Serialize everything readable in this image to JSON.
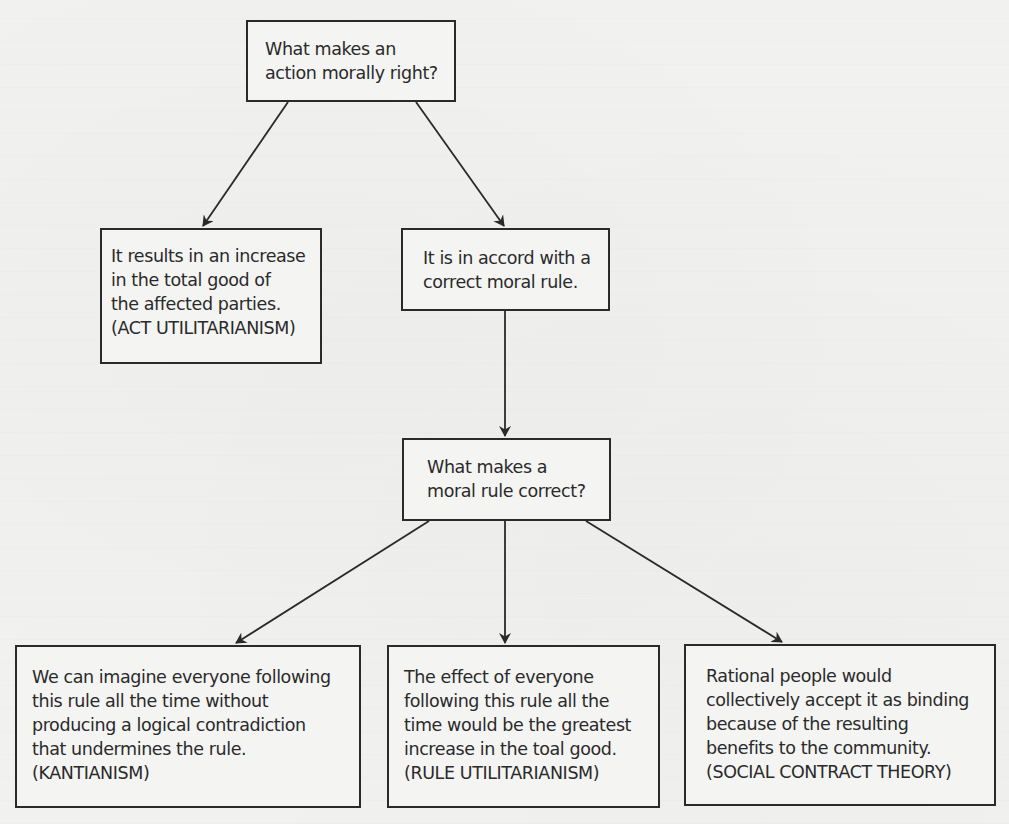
{
  "diagram": {
    "type": "flowchart",
    "colors": {
      "background": "#f1f1f0",
      "box_border": "#2a2a2a",
      "text": "#2a2a2a",
      "arrow": "#2a2a2a"
    },
    "nodes": {
      "root": {
        "lines": [
          "What makes an",
          "action morally right?"
        ]
      },
      "act_util": {
        "lines": [
          "It results in an increase",
          "in the total good of",
          "the affected parties.",
          "(ACT UTILITARIANISM)"
        ]
      },
      "correct_rule": {
        "lines": [
          "It is in accord with a",
          "correct moral rule."
        ]
      },
      "rule_question": {
        "lines": [
          "What makes a",
          "moral rule correct?"
        ]
      },
      "kantianism": {
        "lines": [
          "We can imagine everyone following",
          "this rule all the time without",
          "producing a logical contradiction",
          "that undermines the rule.",
          "(KANTIANISM)"
        ]
      },
      "rule_util": {
        "lines": [
          "The effect of everyone",
          "following this rule all the",
          "time would be the greatest",
          "increase in the toal good.",
          "(RULE UTILITARIANISM)"
        ]
      },
      "social_contract": {
        "lines": [
          "Rational people would",
          "collectively accept it as binding",
          "because of the resulting",
          "benefits to the community.",
          "(SOCIAL CONTRACT THEORY)"
        ]
      }
    },
    "edges": [
      {
        "from": "root",
        "to": "act_util"
      },
      {
        "from": "root",
        "to": "correct_rule"
      },
      {
        "from": "correct_rule",
        "to": "rule_question"
      },
      {
        "from": "rule_question",
        "to": "kantianism"
      },
      {
        "from": "rule_question",
        "to": "rule_util"
      },
      {
        "from": "rule_question",
        "to": "social_contract"
      }
    ]
  }
}
